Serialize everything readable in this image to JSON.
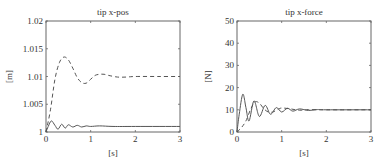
{
  "chart_data": [
    {
      "type": "line",
      "title": "tip x-pos",
      "xlabel": "[s]",
      "ylabel": "[m]",
      "xlim": [
        0,
        3
      ],
      "ylim": [
        1,
        1.02
      ],
      "xticks": [
        "0",
        "1",
        "2",
        "3"
      ],
      "yticks": [
        "1",
        "1.005",
        "1.01",
        "1.015",
        "1.02"
      ],
      "grid": false,
      "series": [
        {
          "name": "dashed",
          "style": "dashed",
          "x": [
            0,
            0.1,
            0.2,
            0.3,
            0.4,
            0.5,
            0.6,
            0.7,
            0.8,
            0.9,
            1.0,
            1.1,
            1.2,
            1.3,
            1.4,
            1.6,
            1.8,
            2.0,
            2.5,
            3.0
          ],
          "values": [
            1.0,
            1.004,
            1.0095,
            1.0125,
            1.0135,
            1.013,
            1.0115,
            1.0098,
            1.0089,
            1.0088,
            1.0095,
            1.0102,
            1.0104,
            1.0104,
            1.0102,
            1.0099,
            1.0099,
            1.01,
            1.01,
            1.01
          ]
        },
        {
          "name": "solid",
          "style": "solid",
          "x": [
            0,
            0.05,
            0.12,
            0.2,
            0.27,
            0.35,
            0.43,
            0.5,
            0.6,
            0.7,
            0.8,
            0.9,
            1.0,
            1.2,
            1.5,
            2.0,
            3.0
          ],
          "values": [
            1.0,
            1.001,
            1.002,
            1.0012,
            1.0005,
            1.0014,
            1.0007,
            1.0013,
            1.0009,
            1.0012,
            1.0009,
            1.0011,
            1.001,
            1.0011,
            1.001,
            1.001,
            1.001
          ]
        }
      ]
    },
    {
      "type": "line",
      "title": "tip x-force",
      "xlabel": "[s]",
      "ylabel": "[N]",
      "xlim": [
        0,
        3
      ],
      "ylim": [
        0,
        50
      ],
      "xticks": [
        "0",
        "1",
        "2",
        "3"
      ],
      "yticks": [
        "0",
        "10",
        "20",
        "30",
        "40",
        "50"
      ],
      "grid": false,
      "series": [
        {
          "name": "solid",
          "style": "solid",
          "x": [
            0,
            0.05,
            0.13,
            0.2,
            0.27,
            0.38,
            0.5,
            0.63,
            0.75,
            0.88,
            1.0,
            1.13,
            1.25,
            1.4,
            1.6,
            1.8,
            2.0,
            3.0
          ],
          "values": [
            0,
            8,
            17,
            11,
            5,
            14,
            7,
            12,
            8,
            11,
            9,
            10.7,
            9.4,
            10.4,
            9.7,
            10.1,
            10,
            10
          ]
        },
        {
          "name": "dashed",
          "style": "dashed",
          "x": [
            0,
            0.1,
            0.2,
            0.3,
            0.4,
            0.5,
            0.6,
            0.7,
            0.8,
            0.9,
            1.0,
            1.2,
            1.4,
            1.6,
            2.0,
            3.0
          ],
          "values": [
            0,
            2,
            5,
            10,
            13.5,
            13,
            10.5,
            9,
            9,
            10,
            10.8,
            10.4,
            9.8,
            10.1,
            10,
            10
          ]
        }
      ]
    }
  ]
}
